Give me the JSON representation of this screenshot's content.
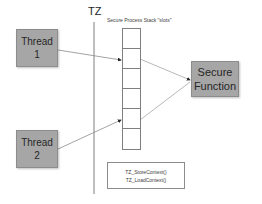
{
  "diagram": {
    "tz_label": "TZ",
    "stack_title": "Secure Process Stack \"slots\"",
    "stack_slot_count": 6,
    "threads": [
      {
        "line1": "Thread",
        "line2": "1"
      },
      {
        "line1": "Thread",
        "line2": "2"
      }
    ],
    "secure_function": {
      "line1": "Secure",
      "line2": "Function"
    },
    "context_box": {
      "line1": "TZ_StoreContext()",
      "line2": "TZ_LoadContext()"
    },
    "colors": {
      "box_fill": "#a6a6a6",
      "line": "#7f7f7f",
      "text": "#262626"
    }
  }
}
